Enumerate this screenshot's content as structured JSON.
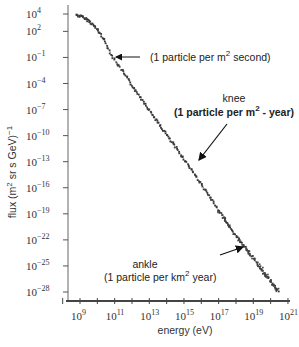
{
  "chart_data": {
    "type": "scatter",
    "title": "",
    "xlabel": "energy (eV)",
    "ylabel": "flux (m² sr s GeV)⁻¹",
    "x_scale": "log",
    "y_scale": "log",
    "xlim_log10": [
      9,
      21
    ],
    "ylim_log10": [
      -28,
      4
    ],
    "grid": false,
    "x_ticks": [
      {
        "exp": "9",
        "value_log10": 9
      },
      {
        "exp": "11",
        "value_log10": 11
      },
      {
        "exp": "13",
        "value_log10": 13
      },
      {
        "exp": "15",
        "value_log10": 15
      },
      {
        "exp": "17",
        "value_log10": 17
      },
      {
        "exp": "19",
        "value_log10": 19
      },
      {
        "exp": "21",
        "value_log10": 21
      }
    ],
    "y_ticks": [
      {
        "exp": "4",
        "value_log10": 4
      },
      {
        "exp": "2",
        "value_log10": 2
      },
      {
        "exp": "-1",
        "value_log10": -1
      },
      {
        "exp": "-4",
        "value_log10": -4
      },
      {
        "exp": "-7",
        "value_log10": -7
      },
      {
        "exp": "-10",
        "value_log10": -10
      },
      {
        "exp": "-13",
        "value_log10": -13
      },
      {
        "exp": "-16",
        "value_log10": -16
      },
      {
        "exp": "-19",
        "value_log10": -19
      },
      {
        "exp": "-22",
        "value_log10": -22
      },
      {
        "exp": "-25",
        "value_log10": -25
      },
      {
        "exp": "-28",
        "value_log10": -28
      }
    ],
    "series": [
      {
        "name": "cosmic ray flux",
        "x_log10": [
          8.8,
          9.2,
          9.6,
          10.0,
          10.4,
          10.9,
          11.5,
          12.0,
          12.5,
          13.0,
          13.5,
          14.0,
          14.5,
          15.0,
          15.5,
          16.0,
          16.5,
          17.0,
          17.5,
          18.0,
          18.5,
          19.0,
          19.5,
          20.0,
          20.5
        ],
        "y_log10": [
          3.9,
          3.6,
          3.1,
          2.2,
          1.0,
          -1.0,
          -2.7,
          -4.2,
          -5.6,
          -7.1,
          -8.5,
          -9.9,
          -11.3,
          -12.7,
          -14.1,
          -15.6,
          -17.1,
          -18.6,
          -20.1,
          -21.5,
          -22.8,
          -24.1,
          -25.5,
          -26.8,
          -28.0
        ]
      }
    ],
    "annotations": [
      {
        "label": "(1 particle per m² second)",
        "text_main": "(1 particle per m",
        "text_sup": "2",
        "text_tail": "  second)",
        "arrow_to_log10": [
          10.9,
          -1.0
        ]
      },
      {
        "label": "knee",
        "text_sub": "(1 particle per m² - year)",
        "text_main": "(1 particle per m",
        "text_sup": "2",
        "text_tail": " - year)",
        "arrow_to_log10": [
          15.75,
          -13.2
        ]
      },
      {
        "label": "ankle",
        "text_sub": "(1 particle per km² year)",
        "text_main": "(1 particle per km",
        "text_sup": "2",
        "text_tail": "  year)",
        "arrow_to_log10": [
          18.5,
          -22.7
        ]
      }
    ],
    "colors": {
      "axis": "#555555",
      "points": "#3a3a3a",
      "text": "#222222"
    }
  },
  "labels": {
    "tick_base": "10",
    "xlabel": "energy (eV)",
    "ylabel": "flux (m",
    "ylabel_sup": "2",
    "ylabel_tail": " sr s GeV)",
    "ylabel_exp": "−1",
    "annot1_main": "(1 particle per m",
    "annot1_sup": "2",
    "annot1_tail": "  second)",
    "knee_title": "knee",
    "knee_main": "(1 particle per m",
    "knee_sup": "2",
    "knee_tail": " - year)",
    "ankle_title": "ankle",
    "ankle_main": "(1 particle per km",
    "ankle_sup": "2",
    "ankle_tail": "  year)"
  }
}
